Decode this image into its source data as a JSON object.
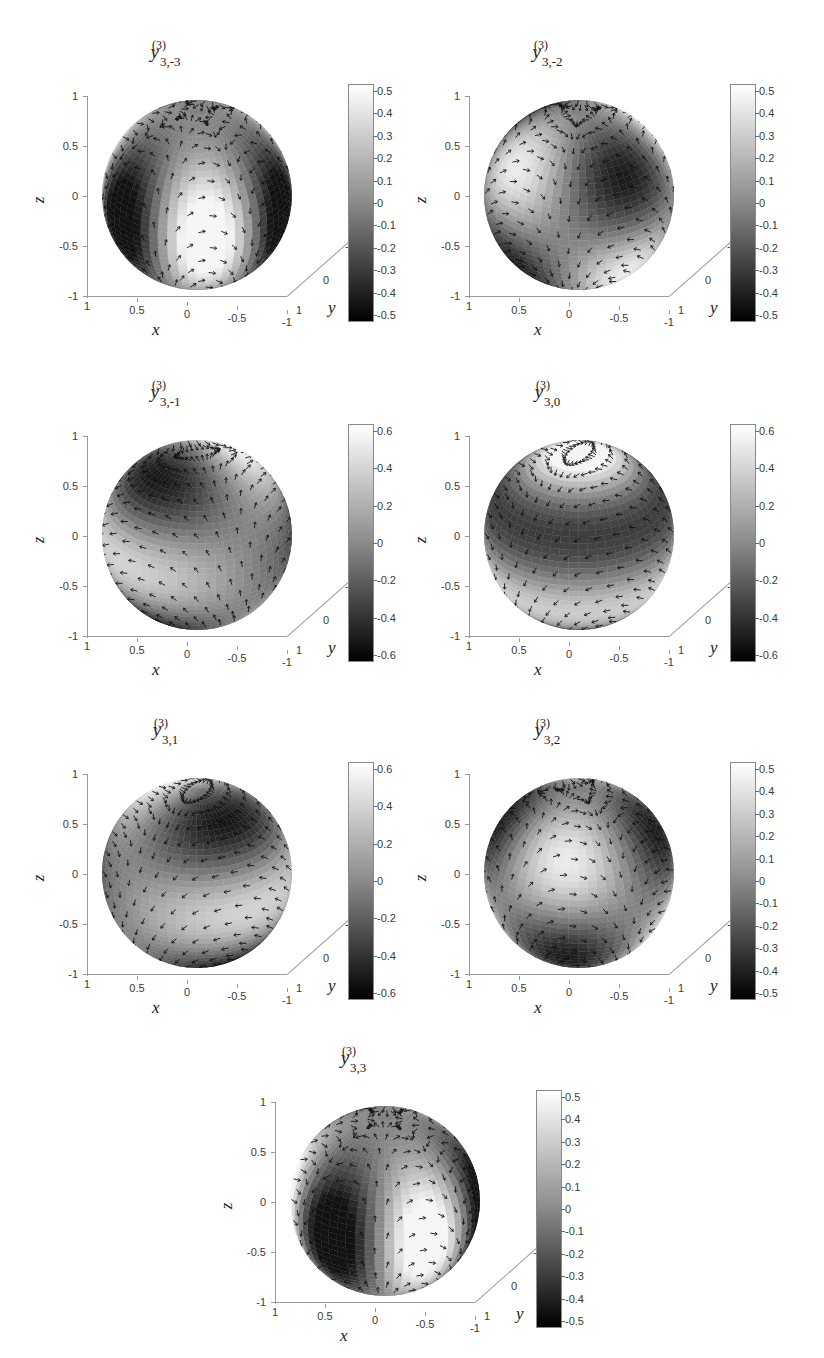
{
  "figure": {
    "kind": "vector spherical harmonics surface plots",
    "background": "#ffffff",
    "colormap": {
      "high": "#ffffff",
      "low": "#000000",
      "name": "gray"
    }
  },
  "axis_labels": {
    "x": "x",
    "y": "y",
    "z": "z"
  },
  "axis_ticks": {
    "z": [
      "1",
      "0.5",
      "0",
      "-0.5",
      "-1"
    ],
    "x": [
      "1",
      "0.5",
      "0",
      "-0.5",
      "-1"
    ],
    "y": [
      "1",
      "0",
      "-1"
    ]
  },
  "colorbar_scales": {
    "half": [
      "0.5",
      "0.4",
      "0.3",
      "0.2",
      "0.1",
      "0",
      "-0.1",
      "-0.2",
      "-0.3",
      "-0.4",
      "-0.5"
    ],
    "sixth": [
      "0.6",
      "0.4",
      "0.2",
      "0",
      "-0.2",
      "-0.4",
      "-0.6"
    ]
  },
  "panels": [
    {
      "id": "y3-m3",
      "base": "y",
      "superscript": "(3)",
      "subscript": "3,-3",
      "colorbar": "half",
      "cmin": -0.55,
      "cmax": 0.55,
      "pattern": "sectoral-6",
      "phase": 0
    },
    {
      "id": "y3-m2",
      "base": "y",
      "superscript": "(3)",
      "subscript": "3,-2",
      "colorbar": "half",
      "cmin": -0.55,
      "cmax": 0.55,
      "pattern": "tesseral-2",
      "phase": 0
    },
    {
      "id": "y3-m1",
      "base": "y",
      "superscript": "(3)",
      "subscript": "3,-1",
      "colorbar": "sixth",
      "cmin": -0.65,
      "cmax": 0.65,
      "pattern": "tesseral-1",
      "phase": 0
    },
    {
      "id": "y3-0",
      "base": "y",
      "superscript": "(3)",
      "subscript": "3,0",
      "colorbar": "sixth",
      "cmin": -0.65,
      "cmax": 0.65,
      "pattern": "zonal",
      "phase": 0
    },
    {
      "id": "y3-p1",
      "base": "y",
      "superscript": "(3)",
      "subscript": "3,1",
      "colorbar": "sixth",
      "cmin": -0.65,
      "cmax": 0.65,
      "pattern": "tesseral-1",
      "phase": 1.5708
    },
    {
      "id": "y3-p2",
      "base": "y",
      "superscript": "(3)",
      "subscript": "3,2",
      "colorbar": "half",
      "cmin": -0.55,
      "cmax": 0.55,
      "pattern": "tesseral-2",
      "phase": 1.5708
    },
    {
      "id": "y3-p3",
      "base": "y",
      "superscript": "(3)",
      "subscript": "3,3",
      "colorbar": "half",
      "cmin": -0.55,
      "cmax": 0.55,
      "pattern": "sectoral-6",
      "phase": 1.0472
    }
  ],
  "chart_data": {
    "type": "heatmap",
    "xlabel": "x",
    "ylabel": "y",
    "zlabel": "z",
    "grid": false,
    "legend": "colorbar-right",
    "xlim": [
      -1,
      1
    ],
    "ylim": [
      -1,
      1
    ],
    "zlim": [
      -1,
      1
    ],
    "series": [
      {
        "name": "y_{3,-3}^{(3)}",
        "degree": 3,
        "order": -3,
        "clim": [
          -0.55,
          0.55
        ],
        "colorbar_ticks": [
          "0.5",
          "0.4",
          "0.3",
          "0.2",
          "0.1",
          "0",
          "-0.1",
          "-0.2",
          "-0.3",
          "-0.4",
          "-0.5"
        ]
      },
      {
        "name": "y_{3,-2}^{(3)}",
        "degree": 3,
        "order": -2,
        "clim": [
          -0.55,
          0.55
        ],
        "colorbar_ticks": [
          "0.5",
          "0.4",
          "0.3",
          "0.2",
          "0.1",
          "0",
          "-0.1",
          "-0.2",
          "-0.3",
          "-0.4",
          "-0.5"
        ]
      },
      {
        "name": "y_{3,-1}^{(3)}",
        "degree": 3,
        "order": -1,
        "clim": [
          -0.65,
          0.65
        ],
        "colorbar_ticks": [
          "0.6",
          "0.4",
          "0.2",
          "0",
          "-0.2",
          "-0.4",
          "-0.6"
        ]
      },
      {
        "name": "y_{3,0}^{(3)}",
        "degree": 3,
        "order": 0,
        "clim": [
          -0.65,
          0.65
        ],
        "colorbar_ticks": [
          "0.6",
          "0.4",
          "0.2",
          "0",
          "-0.2",
          "-0.4",
          "-0.6"
        ]
      },
      {
        "name": "y_{3,1}^{(3)}",
        "degree": 3,
        "order": 1,
        "clim": [
          -0.65,
          0.65
        ],
        "colorbar_ticks": [
          "0.6",
          "0.4",
          "0.2",
          "0",
          "-0.2",
          "-0.4",
          "-0.6"
        ]
      },
      {
        "name": "y_{3,2}^{(3)}",
        "degree": 3,
        "order": 2,
        "clim": [
          -0.55,
          0.55
        ],
        "colorbar_ticks": [
          "0.5",
          "0.4",
          "0.3",
          "0.2",
          "0.1",
          "0",
          "-0.1",
          "-0.2",
          "-0.3",
          "-0.4",
          "-0.5"
        ]
      },
      {
        "name": "y_{3,3}^{(3)}",
        "degree": 3,
        "order": 3,
        "clim": [
          -0.55,
          0.55
        ],
        "colorbar_ticks": [
          "0.5",
          "0.4",
          "0.3",
          "0.2",
          "0.1",
          "0",
          "-0.1",
          "-0.2",
          "-0.3",
          "-0.4",
          "-0.5"
        ]
      }
    ]
  }
}
